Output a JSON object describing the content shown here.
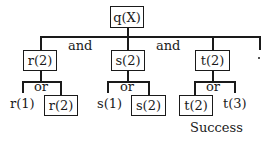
{
  "root": {
    "label": "q(X)"
  },
  "connectors": {
    "and_1": "and",
    "and_2": "and"
  },
  "goals": [
    {
      "label": "r(2)",
      "connector": "or",
      "left": "r(1)",
      "right": "r(2)"
    },
    {
      "label": "s(2)",
      "connector": "or",
      "left": "s(1)",
      "right": "s(2)"
    },
    {
      "label": "t(2)",
      "connector": "or",
      "left": "t(2)",
      "right": "t(3)"
    }
  ],
  "result": {
    "label": "Success"
  }
}
